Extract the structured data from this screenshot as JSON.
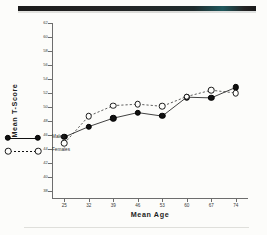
{
  "chart_data": {
    "type": "line",
    "title": "",
    "xlabel": "Mean   Age",
    "ylabel": "Mean   T-Score",
    "x": [
      25,
      32,
      39,
      46,
      53,
      60,
      67,
      74
    ],
    "xtick_labels": [
      "25",
      "32",
      "39",
      "46",
      "53",
      "60",
      "67",
      "74"
    ],
    "ytick_labels": [
      "62",
      "60",
      "58",
      "56",
      "54",
      "52",
      "50",
      "48",
      "46",
      "44",
      "42",
      "40",
      "38"
    ],
    "ytick_values": [
      62,
      60,
      58,
      56,
      54,
      52,
      50,
      48,
      46,
      44,
      42,
      40,
      38
    ],
    "xlim": [
      21.5,
      77.5
    ],
    "ylim": [
      37.0,
      62.0
    ],
    "grid": false,
    "legend_position": "inside-lower-left",
    "series": [
      {
        "name": "Males",
        "marker": "filled-circle",
        "linestyle": "solid",
        "color": "#111111",
        "values": [
          45.7,
          47.2,
          48.4,
          49.2,
          48.7,
          51.4,
          51.3,
          52.8
        ]
      },
      {
        "name": "Females",
        "marker": "open-circle",
        "linestyle": "dashed",
        "color": "#1a1a1a",
        "values": [
          44.8,
          48.7,
          50.2,
          50.4,
          50.1,
          51.5,
          52.4,
          52.0
        ]
      }
    ]
  },
  "legend": {
    "entries": [
      {
        "label": "Males"
      },
      {
        "label": "Females"
      }
    ]
  }
}
